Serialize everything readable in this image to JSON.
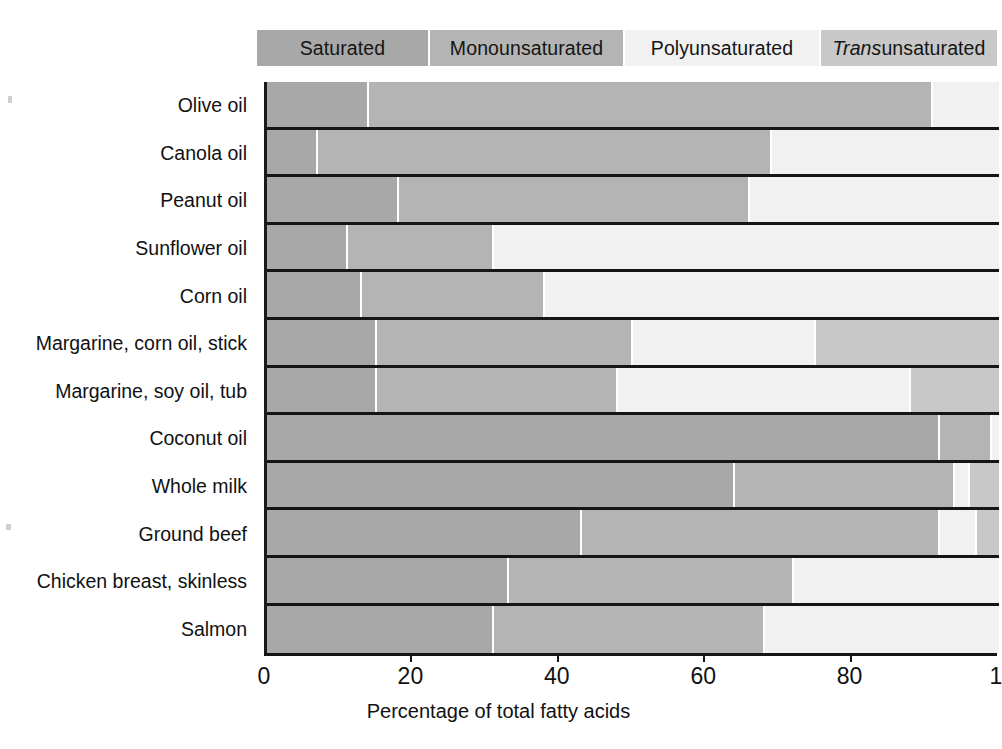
{
  "legend": {
    "items": [
      {
        "label": "Saturated",
        "color": "#a8a8a8",
        "width_px": 173
      },
      {
        "label": "Monounsaturated",
        "color": "#b4b4b4",
        "width_px": 195
      },
      {
        "label": "Polyunsaturated",
        "color": "#f1f1f1",
        "width_px": 196
      },
      {
        "label": "Trans unsaturated",
        "label_italic_prefix": "Trans",
        "label_rest": " unsaturated",
        "color": "#c8c8c8",
        "width_px": 176
      }
    ]
  },
  "axis": {
    "title": "Percentage of total fatty acids",
    "ticks": [
      {
        "value": 0,
        "label": "0"
      },
      {
        "value": 20,
        "label": "20"
      },
      {
        "value": 40,
        "label": "40"
      },
      {
        "value": 60,
        "label": "60"
      },
      {
        "value": 80,
        "label": "80"
      },
      {
        "value": 100,
        "label": "1"
      }
    ],
    "min": 0,
    "max": 100
  },
  "colors": {
    "saturated": "#a8a8a8",
    "monounsaturated": "#b4b4b4",
    "polyunsaturated": "#f1f1f1",
    "trans": "#c8c8c8",
    "rule": "#151515",
    "background": "#ffffff"
  },
  "chart_data": {
    "type": "bar",
    "orientation": "horizontal",
    "stacked": true,
    "normalized": true,
    "title": "",
    "xlabel": "Percentage of total fatty acids",
    "ylabel": "",
    "xlim": [
      0,
      100
    ],
    "grid": false,
    "legend_position": "top",
    "series_names": [
      "Saturated",
      "Monounsaturated",
      "Polyunsaturated",
      "Trans unsaturated"
    ],
    "categories": [
      "Olive oil",
      "Canola oil",
      "Peanut oil",
      "Sunflower oil",
      "Corn oil",
      "Margarine, corn oil, stick",
      "Margarine, soy oil, tub",
      "Coconut oil",
      "Whole milk",
      "Ground beef",
      "Chicken breast, skinless",
      "Salmon"
    ],
    "series": [
      {
        "name": "Saturated",
        "values": [
          14,
          7,
          18,
          11,
          13,
          15,
          15,
          92,
          64,
          43,
          33,
          31
        ]
      },
      {
        "name": "Monounsaturated",
        "values": [
          77,
          62,
          48,
          20,
          25,
          35,
          33,
          7,
          30,
          49,
          39,
          37
        ]
      },
      {
        "name": "Polyunsaturated",
        "values": [
          9,
          31,
          34,
          69,
          62,
          25,
          40,
          1,
          2,
          5,
          28,
          32
        ]
      },
      {
        "name": "Trans unsaturated",
        "values": [
          0,
          0,
          0,
          0,
          0,
          25,
          12,
          0,
          4,
          3,
          0,
          0
        ]
      }
    ],
    "rows": [
      {
        "category": "Olive oil",
        "saturated": 14,
        "monounsaturated": 77,
        "polyunsaturated": 9,
        "trans": 0
      },
      {
        "category": "Canola oil",
        "saturated": 7,
        "monounsaturated": 62,
        "polyunsaturated": 31,
        "trans": 0
      },
      {
        "category": "Peanut oil",
        "saturated": 18,
        "monounsaturated": 48,
        "polyunsaturated": 34,
        "trans": 0
      },
      {
        "category": "Sunflower oil",
        "saturated": 11,
        "monounsaturated": 20,
        "polyunsaturated": 69,
        "trans": 0
      },
      {
        "category": "Corn oil",
        "saturated": 13,
        "monounsaturated": 25,
        "polyunsaturated": 62,
        "trans": 0
      },
      {
        "category": "Margarine, corn oil, stick",
        "saturated": 15,
        "monounsaturated": 35,
        "polyunsaturated": 25,
        "trans": 25
      },
      {
        "category": "Margarine, soy oil, tub",
        "saturated": 15,
        "monounsaturated": 33,
        "polyunsaturated": 40,
        "trans": 12
      },
      {
        "category": "Coconut oil",
        "saturated": 92,
        "monounsaturated": 7,
        "polyunsaturated": 1,
        "trans": 0
      },
      {
        "category": "Whole milk",
        "saturated": 64,
        "monounsaturated": 30,
        "polyunsaturated": 2,
        "trans": 4
      },
      {
        "category": "Ground beef",
        "saturated": 43,
        "monounsaturated": 49,
        "polyunsaturated": 5,
        "trans": 3
      },
      {
        "category": "Chicken breast, skinless",
        "saturated": 33,
        "monounsaturated": 39,
        "polyunsaturated": 28,
        "trans": 0
      },
      {
        "category": "Salmon",
        "saturated": 31,
        "monounsaturated": 37,
        "polyunsaturated": 32,
        "trans": 0
      }
    ]
  }
}
